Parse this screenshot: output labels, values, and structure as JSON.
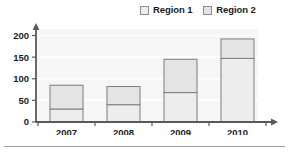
{
  "chart_data": {
    "type": "bar",
    "subtype": "stacked-bar",
    "title": "",
    "xlabel": "",
    "ylabel": "",
    "categories": [
      "2007",
      "2008",
      "2009",
      "2010"
    ],
    "series": [
      {
        "name": "Region 1",
        "values": [
          30,
          40,
          68,
          147
        ],
        "color": "#ededed",
        "border": "#7d7d7d"
      },
      {
        "name": "Region 2",
        "values": [
          55,
          42,
          77,
          45
        ],
        "color": "#e4e4e4",
        "border": "#7d7d7d"
      }
    ],
    "totals": [
      85,
      82,
      145,
      192
    ],
    "ylim": [
      0,
      215
    ],
    "yticks": [
      0,
      50,
      100,
      150,
      200
    ],
    "ytick_labels": [
      "0",
      "50",
      "100",
      "150",
      "200"
    ],
    "grid": true,
    "grid_axis": "y",
    "legend_position": "top-right",
    "axis_style": "arrow",
    "plot_background": "#f6f6f6"
  },
  "legend": {
    "entries": [
      {
        "label": "Region 1",
        "swatch": "legend-swatch-region-1"
      },
      {
        "label": "Region 2",
        "swatch": "legend-swatch-region-2"
      }
    ]
  },
  "axes": {
    "y_ticks": [
      "0",
      "50",
      "100",
      "150",
      "200"
    ],
    "x_ticks": [
      "2007",
      "2008",
      "2009",
      "2010"
    ]
  },
  "colors": {
    "axis": "#595959",
    "grid": "#ffffff",
    "plot_bg": "#f6f6f6",
    "series_1_fill": "#ededed",
    "series_2_fill": "#e4e4e4",
    "bar_border": "#7d7d7d",
    "text": "#1b1b1b",
    "rule": "#9aa0a6"
  }
}
